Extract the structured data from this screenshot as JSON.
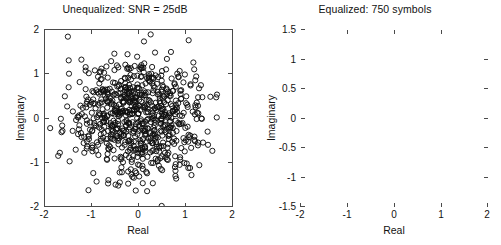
{
  "figure": {
    "background": "#ffffff",
    "marker_color": "#101010",
    "axis_color": "#4a4a4a"
  },
  "panels": [
    {
      "id": "unequalized",
      "title": "Unequalized: SNR = 25dB",
      "xlabel": "Real",
      "ylabel": "Imaginary",
      "xticks": [
        "-2",
        "-1",
        "0",
        "1",
        "2"
      ],
      "yticks": [
        "2",
        "1",
        "0",
        "-1",
        "-2"
      ]
    },
    {
      "id": "equalized",
      "title": "Equalized: 750 symbols",
      "xlabel": "Real",
      "ylabel": "Imaginary",
      "xticks": [
        "-2",
        "-1",
        "0",
        "1",
        "2"
      ],
      "yticks": [
        "1.5",
        "1",
        "0.5",
        "0",
        "-0.5",
        "-1",
        "-1.5"
      ]
    }
  ],
  "chart_data": [
    {
      "type": "scatter",
      "id": "unequalized",
      "title": "Unequalized: SNR = 25dB",
      "xlabel": "Real",
      "ylabel": "Imaginary",
      "xlim": [
        -2,
        2
      ],
      "ylim": [
        -2,
        2
      ],
      "xticks": [
        -2,
        -1,
        0,
        1,
        2
      ],
      "yticks": [
        -2,
        -1,
        0,
        1,
        2
      ],
      "grid": false,
      "legend": null,
      "marker": "open-circle",
      "n_points": 750,
      "description": "Received 16-QAM symbols before equalization: a dense isotropic noisy cloud centered near the origin, roughly Gaussian with standard deviation about 0.65 and a few outliers reaching the plot limits.",
      "distribution": {
        "kind": "gaussian-cloud",
        "center": [
          -0.05,
          -0.02
        ],
        "sigma": [
          0.66,
          0.62
        ]
      },
      "x": [
        -0.05,
        0.32,
        -0.64,
        0.71,
        0.12,
        -0.43,
        0.88,
        -1.12,
        0.25,
        -0.21,
        0.55,
        -0.87,
        1.02,
        0.04,
        -0.33,
        0.66,
        -0.55,
        0.19,
        -1.31,
        0.41,
        0.77,
        -0.08,
        -0.72,
        0.93,
        -0.26,
        0.14,
        0.6,
        -1.02,
        0.36,
        -0.47,
        1.21,
        -0.15,
        0.49,
        -0.93,
        0.07,
        0.82,
        -0.61,
        0.28,
        -0.38,
        1.14,
        -1.22,
        0.02,
        0.69,
        -0.75,
        0.45,
        -0.11,
        0.97,
        -0.52,
        0.23,
        -1.41,
        0.58,
        0.33,
        -0.29,
        0.86,
        -0.68,
        1.33,
        0.16,
        -0.84,
        0.51,
        -0.19,
        0.74,
        -1.07,
        0.39,
        0.09,
        -0.57,
        1.08,
        -0.35,
        0.63,
        -0.98,
        0.27,
        -0.45,
        0.91,
        0.01,
        -1.17,
        0.47,
        0.79,
        -0.24,
        0.56,
        -0.66,
        1.26,
        -0.05,
        0.35,
        -1.28,
        0.68,
        -0.41,
        0.18,
        1.0,
        -0.78,
        0.43,
        -0.13,
        0.85,
        -0.58,
        0.3,
        1.45,
        -0.9,
        0.1,
        0.62,
        -0.31,
        0.75,
        -1.11,
        0.22,
        -0.49,
        0.99,
        0.06,
        -0.7,
        0.52,
        1.16,
        -0.2,
        0.38,
        -1.05,
        0.8,
        -0.37,
        0.15,
        0.65,
        -0.82,
        1.05,
        0.29,
        -0.6,
        0.44,
        -0.09,
        0.9,
        -1.35,
        0.2,
        0.71,
        -0.27,
        0.48,
        -0.95,
        1.3,
        0.03,
        -0.53,
        0.84,
        -0.17,
        0.59,
        -1.2,
        0.26,
        0.73,
        -0.4,
        1.1,
        -0.73,
        0.37,
        0.11,
        -0.63,
        0.95,
        -0.3,
        0.67,
        -1.0,
        0.21,
        -0.46,
        0.88,
        0.0,
        -1.25,
        0.5,
        0.78,
        -0.22,
        0.54,
        -0.69,
        1.22,
        -0.07,
        0.34,
        -1.3,
        0.7,
        -0.42,
        0.17,
        1.03,
        -0.8,
        0.46,
        -0.12,
        0.87,
        -0.56,
        0.31,
        1.5,
        -0.92,
        0.08,
        0.64,
        -0.34,
        0.76,
        -1.14,
        0.24,
        -0.5,
        0.96,
        0.05,
        -0.71,
        0.53,
        1.18,
        -0.18,
        0.4,
        -1.08,
        0.83,
        -0.39,
        0.13,
        0.61,
        -0.85,
        1.07,
        0.32,
        -0.62,
        0.42,
        -0.1,
        0.92,
        -1.38,
        0.19
      ],
      "y": [
        0.02,
        -0.25,
        0.41,
        0.18,
        -0.63,
        0.77,
        -0.11,
        0.34,
        1.02,
        -0.48,
        0.09,
        -0.81,
        0.27,
        1.21,
        -0.36,
        0.52,
        -0.7,
        0.88,
        0.05,
        -1.05,
        0.31,
        -0.22,
        0.66,
        -0.43,
        1.13,
        0.15,
        -0.92,
        0.38,
        -0.57,
        0.73,
        0.0,
        -1.3,
        0.46,
        0.24,
        -0.68,
        0.95,
        -0.14,
        0.58,
        -0.39,
        1.27,
        0.11,
        -0.77,
        0.29,
        0.64,
        -1.12,
        0.42,
        -0.2,
        0.81,
        -0.5,
        0.17,
        1.35,
        -0.33,
        0.71,
        -0.86,
        0.06,
        0.49,
        -1.22,
        0.36,
        -0.61,
        0.99,
        0.2,
        -0.45,
        0.61,
        1.05,
        -0.28,
        0.78,
        -0.97,
        0.13,
        0.44,
        -0.72,
        1.16,
        -0.09,
        0.55,
        -0.4,
        0.86,
        0.26,
        -1.18,
        0.33,
        -0.66,
        0.69,
        1.4,
        -0.52,
        0.08,
        0.91,
        -0.3,
        0.6,
        -1.0,
        0.22,
        0.47,
        -0.83,
        1.08,
        -0.16,
        0.74,
        -0.58,
        0.04,
        1.25,
        -0.37,
        0.65,
        -1.08,
        0.39,
        0.84,
        -0.24,
        0.51,
        -0.75,
        1.18,
        0.1,
        -0.47,
        0.7,
        -0.95,
        0.32,
        1.02,
        -0.64,
        0.43,
        -0.19,
        0.89,
        -0.41,
        0.21,
        1.3,
        -0.88,
        0.57,
        0.07,
        -0.69,
        0.96,
        -0.31,
        0.48,
        -1.15,
        0.35,
        0.76,
        -0.54,
        1.1,
        -0.12,
        0.62,
        -0.8,
        0.25,
        0.93,
        -0.44,
        0.16,
        -1.26,
        0.53,
        0.79,
        -0.27,
        0.68,
        -0.99,
        1.22,
        0.03,
        -0.59,
        0.85,
        -0.21,
        0.45,
        -1.04,
        0.3,
        0.72,
        -0.49,
        1.12,
        -0.76,
        0.4,
        0.14,
        -0.67,
        0.98,
        -0.34,
        0.63,
        -1.2,
        0.23,
        -0.51,
        0.9,
        0.01,
        -1.32,
        0.56,
        0.82,
        -0.26,
        0.5,
        -0.71,
        1.15,
        -0.06,
        0.37,
        -1.28,
        0.67,
        -0.42,
        0.19,
        1.0,
        -0.79,
        0.46,
        -0.15,
        0.87,
        -0.55,
        0.28,
        -1.6,
        0.94,
        0.12,
        0.59,
        -0.38,
        0.8,
        -1.1,
        0.24
      ]
    },
    {
      "type": "scatter",
      "id": "equalized",
      "title": "Equalized: 750 symbols",
      "xlabel": "Real",
      "ylabel": "Imaginary",
      "xlim": [
        -2,
        2
      ],
      "ylim": [
        -1.5,
        1.5
      ],
      "xticks": [
        -2,
        -1,
        0,
        1,
        2
      ],
      "yticks": [
        -1.5,
        -1,
        -0.5,
        0,
        0.5,
        1,
        1.5
      ],
      "grid": false,
      "legend": null,
      "marker": "open-circle",
      "n_points": 750,
      "description": "Equalized 16-QAM constellation: 16 tight clusters on a 4x4 lattice at real and imaginary levels of about -0.9, -0.3, +0.3, +0.9, each cluster holding roughly 45 symbols with a scatter radius near 0.07, plus two visible stray outliers.",
      "constellation": {
        "order": 16,
        "levels_real": [
          -0.9,
          -0.3,
          0.3,
          0.9
        ],
        "levels_imag": [
          -0.9,
          -0.3,
          0.3,
          0.9
        ],
        "points_per_cluster": 46,
        "cluster_sigma": 0.055,
        "outliers": [
          [
            -0.33,
            0.7
          ],
          [
            -0.33,
            -0.55
          ]
        ]
      }
    }
  ]
}
